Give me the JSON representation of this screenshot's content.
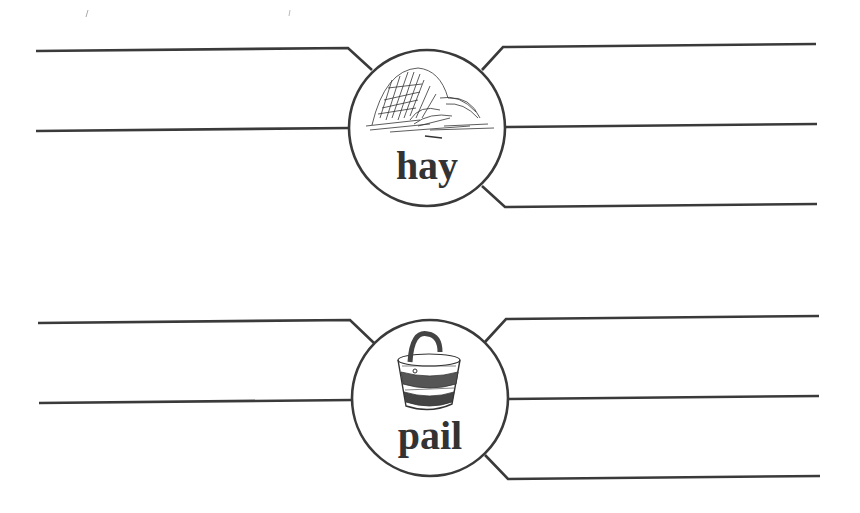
{
  "worksheet": {
    "items": [
      {
        "word": "hay",
        "picture": "haystack-icon",
        "circle": {
          "cx": 427,
          "cy": 128,
          "r": 78
        },
        "lines": [
          "M36 51 L348 48 L372 70",
          "M36 131 L350 128",
          "M482 70 L503 47 L816 44",
          "M505 127 L817 124",
          "M482 186 L505 207 L817 204"
        ]
      },
      {
        "word": "pail",
        "picture": "bucket-icon",
        "circle": {
          "cx": 430,
          "cy": 398,
          "r": 78
        },
        "lines": [
          "M38 323 L350 320 L374 343",
          "M39 403 L352 400",
          "M485 342 L506 319 L819 316",
          "M508 399 L819 396",
          "M485 455 L508 479 L820 476"
        ]
      }
    ],
    "colors": {
      "ink": "#3a3a3a",
      "paper": "#ffffff"
    }
  }
}
